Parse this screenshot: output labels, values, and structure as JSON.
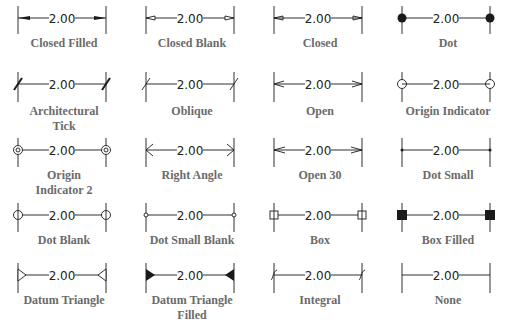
{
  "figure": {
    "dimension_value": "2.00",
    "ink_color": "#1a1a1a",
    "label_color": "#6b6b6b",
    "items": [
      {
        "label": "Closed Filled",
        "style": "closed-filled"
      },
      {
        "label": "Closed Blank",
        "style": "closed-blank"
      },
      {
        "label": "Closed",
        "style": "closed"
      },
      {
        "label": "Dot",
        "style": "dot"
      },
      {
        "label": "Architectural Tick",
        "label_lines": [
          "Architectural",
          "Tick"
        ],
        "style": "arch-tick"
      },
      {
        "label": "Oblique",
        "style": "oblique"
      },
      {
        "label": "Open",
        "style": "open"
      },
      {
        "label": "Origin Indicator",
        "style": "origin"
      },
      {
        "label": "Origin Indicator 2",
        "label_lines": [
          "Origin",
          "Indicator 2"
        ],
        "style": "origin2"
      },
      {
        "label": "Right Angle",
        "style": "right-angle"
      },
      {
        "label": "Open 30",
        "style": "open30"
      },
      {
        "label": "Dot Small",
        "style": "dot-small"
      },
      {
        "label": "Dot Blank",
        "style": "dot-blank"
      },
      {
        "label": "Dot Small Blank",
        "style": "dot-small-blank"
      },
      {
        "label": "Box",
        "style": "box"
      },
      {
        "label": "Box Filled",
        "style": "box-filled"
      },
      {
        "label": "Datum Triangle",
        "style": "datum"
      },
      {
        "label": "Datum Triangle Filled",
        "label_lines": [
          "Datum Triangle",
          "Filled"
        ],
        "style": "datum-filled"
      },
      {
        "label": "Integral",
        "style": "integral"
      },
      {
        "label": "None",
        "style": "none"
      }
    ]
  }
}
